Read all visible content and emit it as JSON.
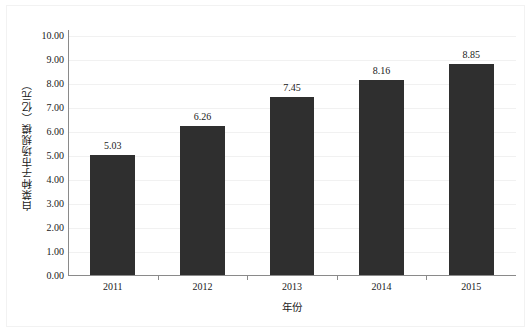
{
  "chart_data": {
    "type": "bar",
    "title": "",
    "subtitle": "",
    "xlabel": "年份",
    "ylabel": "白菜种子市场规模（亿元）",
    "categories": [
      "2011",
      "2012",
      "2013",
      "2014",
      "2015"
    ],
    "values": [
      5.03,
      6.26,
      7.45,
      8.16,
      8.85
    ],
    "data_labels": [
      "5.03",
      "6.26",
      "7.45",
      "8.16",
      "8.85"
    ],
    "series": [
      {
        "name": "白菜种子市场规模",
        "values": [
          5.03,
          6.26,
          7.45,
          8.16,
          8.85
        ]
      }
    ],
    "ylim": [
      0,
      10
    ],
    "ytick_step": 1,
    "ytick_labels": [
      "10.00",
      "9.00",
      "8.00",
      "7.00",
      "6.00",
      "5.00",
      "4.00",
      "3.00",
      "2.00",
      "1.00",
      "0.00"
    ],
    "ytick_values": [
      10,
      9,
      8,
      7,
      6,
      5,
      4,
      3,
      2,
      1,
      0
    ],
    "grid": true,
    "grid_axis": "y",
    "legend": false,
    "legend_position": "none",
    "bar_color": "#2f2f2f",
    "grid_color": "#f1f1f1",
    "axis_color": "#8a8a8a",
    "text_color": "#1a1a1a",
    "background_color": "#ffffff"
  }
}
